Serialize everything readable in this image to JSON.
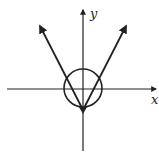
{
  "diagram": {
    "type": "graph-sketch",
    "axes": {
      "x_label": "x",
      "y_label": "y"
    },
    "curves": [
      {
        "name": "absolute-value-v",
        "description": "V-shaped graph with vertex below origin on y-axis, arms extending upward with arrows"
      },
      {
        "name": "circle",
        "description": "circle centered at origin"
      }
    ],
    "colors": {
      "stroke": "#222222",
      "background": "#ffffff"
    }
  }
}
